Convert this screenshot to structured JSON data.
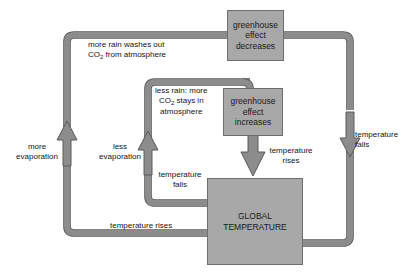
{
  "diagram": {
    "type": "feedback-loop",
    "colors": {
      "background": "#ffffff",
      "pipe_fill": "#8c8c8c",
      "pipe_stroke": "#5a5a5a",
      "box_fill": "#a8a8a8",
      "box_stroke": "#6e6e6e",
      "text": "#141414"
    },
    "boxes": [
      {
        "id": "greenhouse-effect-decreases",
        "lines": [
          "greenhouse",
          "effect",
          "decreases"
        ],
        "text": "greenhouse effect decreases"
      },
      {
        "id": "greenhouse-effect-increases",
        "lines": [
          "greenhouse",
          "effect",
          "increases"
        ],
        "text": "greenhouse effect increases"
      },
      {
        "id": "global-temperature",
        "lines": [
          "GLOBAL",
          "TEMPERATURE"
        ],
        "text": "GLOBAL TEMPERATURE"
      }
    ],
    "labels": {
      "more_rain_line1": "more rain washes out",
      "more_rain_line2_pre": "CO",
      "more_rain_line2_sub": "2",
      "more_rain_line2_post": " from atmosphere",
      "less_rain_line1": "less rain: more",
      "less_rain_line2_pre": "CO",
      "less_rain_line2_sub": "2",
      "less_rain_line2_post": " stays in",
      "less_rain_line3": "atmosphere",
      "more_evaporation_line1": "more",
      "more_evaporation_line2": "evaporation",
      "less_evaporation_line1": "less",
      "less_evaporation_line2": "evaporation",
      "temperature_falls_inner_line1": "temperature",
      "temperature_falls_inner_line2": "falls",
      "temperature_rises_center_line1": "temperature",
      "temperature_rises_center_line2": "rises",
      "temperature_falls_right_line1": "temperature",
      "temperature_falls_right_line2": "falls",
      "temperature_rises_bottom": "temperature rises"
    },
    "box_text": {
      "gh_decrease_l1": "greenhouse",
      "gh_decrease_l2": "effect",
      "gh_decrease_l3": "decreases",
      "gh_increase_l1": "greenhouse",
      "gh_increase_l2": "effect",
      "gh_increase_l3": "increases",
      "global_temp_l1": "GLOBAL",
      "global_temp_l2": "TEMPERATURE"
    }
  }
}
